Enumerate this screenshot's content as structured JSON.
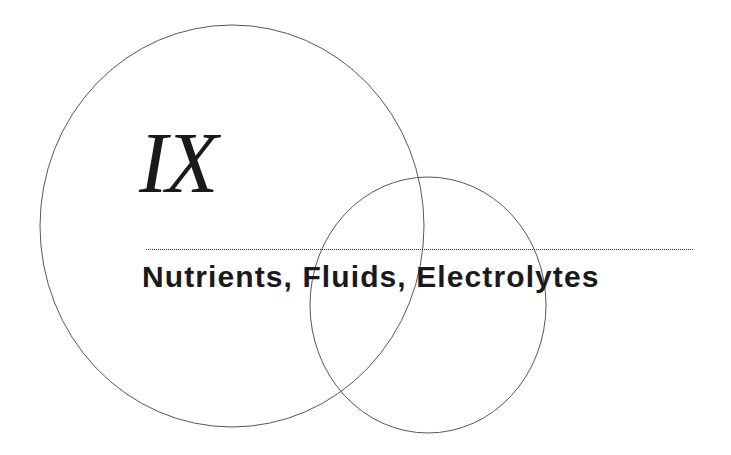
{
  "chapter": {
    "numeral": "IX",
    "title": "Nutrients, Fluids, Electrolytes"
  },
  "decorations": {
    "large_circle": {
      "cx": 232,
      "cy": 226,
      "rx": 192,
      "ry": 201
    },
    "small_circle": {
      "cx": 428,
      "cy": 305,
      "rx": 118,
      "ry": 128
    },
    "line_color": "#444444",
    "text_color": "#1a1a1a",
    "background": "#ffffff"
  }
}
